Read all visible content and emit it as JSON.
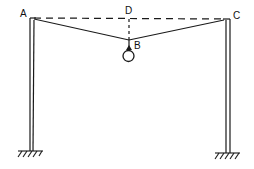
{
  "diagram": {
    "type": "frame-with-suspended-load",
    "labels": {
      "A": "A",
      "B": "B",
      "C": "C",
      "D": "D"
    },
    "points": {
      "A": [
        33,
        18
      ],
      "C": [
        229,
        19
      ],
      "B": [
        129,
        40
      ],
      "D": [
        129,
        19
      ]
    },
    "elements": [
      {
        "name": "left-post",
        "kind": "column"
      },
      {
        "name": "right-post",
        "kind": "column"
      },
      {
        "name": "cable-AB",
        "kind": "cable"
      },
      {
        "name": "cable-BC",
        "kind": "cable"
      },
      {
        "name": "reference-line-AC",
        "kind": "dashed"
      },
      {
        "name": "sag-line-DB",
        "kind": "dashed"
      },
      {
        "name": "load-ring",
        "kind": "weight"
      },
      {
        "name": "left-ground-support",
        "kind": "fixed-support"
      },
      {
        "name": "right-ground-support",
        "kind": "fixed-support"
      }
    ],
    "colors": {
      "line": "#1a1a1a",
      "background": "#ffffff"
    }
  }
}
